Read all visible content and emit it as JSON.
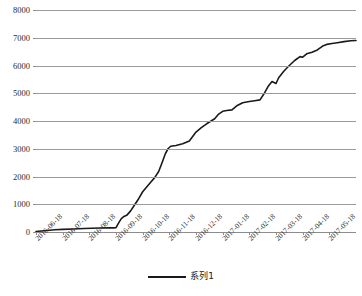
{
  "chart_data": {
    "type": "line",
    "title": "",
    "xlabel": "",
    "ylabel": "",
    "ylim": [
      0,
      8000
    ],
    "ytick_values": [
      0,
      1000,
      2000,
      3000,
      4000,
      5000,
      6000,
      7000,
      8000
    ],
    "ytick_labels": [
      "0",
      "1000",
      "2000",
      "3000",
      "4000",
      "5000",
      "6000",
      "7000",
      "8000"
    ],
    "grid": true,
    "legend_position": "bottom",
    "categories": [
      "2016-06-18",
      "2016-07-18",
      "2016-08-18",
      "2016-09-18",
      "2016-10-18",
      "2016-11-18",
      "2016-12-18",
      "2017-01-18",
      "2017-02-18",
      "2017-03-18",
      "2017-04-18",
      "2017-05-18"
    ],
    "series": [
      {
        "name": "系列1",
        "color": "#1a1a1a",
        "values": [
          20,
          60,
          110,
          150,
          1450,
          3050,
          3600,
          4350,
          4700,
          5350,
          6300,
          6900
        ]
      }
    ],
    "dense_points": [
      [
        0.0,
        20
      ],
      [
        0.3,
        45
      ],
      [
        0.7,
        80
      ],
      [
        1.0,
        95
      ],
      [
        1.4,
        110
      ],
      [
        1.8,
        125
      ],
      [
        2.1,
        135
      ],
      [
        2.4,
        142
      ],
      [
        2.7,
        148
      ],
      [
        2.9,
        150
      ],
      [
        3.0,
        155
      ],
      [
        3.1,
        330
      ],
      [
        3.2,
        480
      ],
      [
        3.3,
        560
      ],
      [
        3.4,
        600
      ],
      [
        3.55,
        760
      ],
      [
        3.7,
        980
      ],
      [
        3.85,
        1200
      ],
      [
        4.0,
        1450
      ],
      [
        4.15,
        1620
      ],
      [
        4.3,
        1790
      ],
      [
        4.45,
        1960
      ],
      [
        4.6,
        2180
      ],
      [
        4.72,
        2480
      ],
      [
        4.85,
        2820
      ],
      [
        4.95,
        3000
      ],
      [
        5.05,
        3090
      ],
      [
        5.25,
        3120
      ],
      [
        5.5,
        3180
      ],
      [
        5.75,
        3280
      ],
      [
        6.0,
        3600
      ],
      [
        6.2,
        3760
      ],
      [
        6.4,
        3900
      ],
      [
        6.55,
        3990
      ],
      [
        6.7,
        4080
      ],
      [
        6.85,
        4250
      ],
      [
        7.0,
        4350
      ],
      [
        7.15,
        4380
      ],
      [
        7.35,
        4400
      ],
      [
        7.55,
        4560
      ],
      [
        7.75,
        4660
      ],
      [
        8.0,
        4700
      ],
      [
        8.2,
        4730
      ],
      [
        8.4,
        4760
      ],
      [
        8.55,
        4980
      ],
      [
        8.7,
        5240
      ],
      [
        8.85,
        5420
      ],
      [
        9.0,
        5350
      ],
      [
        9.1,
        5560
      ],
      [
        9.3,
        5800
      ],
      [
        9.5,
        6000
      ],
      [
        9.7,
        6180
      ],
      [
        9.9,
        6320
      ],
      [
        10.0,
        6300
      ],
      [
        10.15,
        6420
      ],
      [
        10.35,
        6480
      ],
      [
        10.55,
        6560
      ],
      [
        10.75,
        6700
      ],
      [
        10.9,
        6760
      ],
      [
        11.1,
        6790
      ],
      [
        11.3,
        6820
      ],
      [
        11.55,
        6860
      ],
      [
        11.8,
        6890
      ],
      [
        12.0,
        6900
      ]
    ]
  },
  "legend": {
    "swatch_name": "series-1-line-swatch",
    "label": "系列1"
  }
}
